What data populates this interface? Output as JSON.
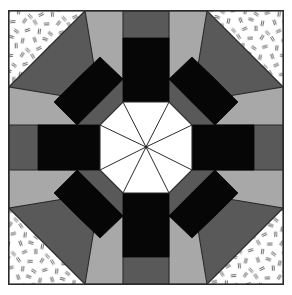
{
  "figure": {
    "title": "Eight-Pointed Star Quilt Block",
    "kind": "geometric-pattern",
    "canvas": {
      "width": 292,
      "height": 295
    },
    "background": "#ffffff"
  },
  "frame": {
    "name": "outer-square-frame",
    "x": 8,
    "y": 10,
    "width": 276,
    "height": 275,
    "fill": "#ffffff",
    "stroke": "#2b2b2b",
    "stroke_width": 1.6
  },
  "palette": {
    "white": "#ffffff",
    "black": "#060606",
    "dark_gray": "#595959",
    "light_gray": "#a8a8a8",
    "outline": "#2b2b2b",
    "texture_mark": "#555555"
  },
  "geometry": {
    "center": {
      "x": 146,
      "y": 147
    },
    "frame_min": 8,
    "frame_max": 284,
    "frame_top": 10,
    "frame_bottom": 285,
    "corner_cut": 77,
    "octagon_ring_outer_note": "octagon inscribed in frame with 77px corner cuts",
    "inner_octagon_radius": 57,
    "black_square_half_width": 23,
    "black_square_inner_edge": 34,
    "black_square_outer_edge": 80,
    "ray_count": 8
  },
  "regions": [
    {
      "name": "corner-triangle-top-left",
      "fill": "textured-white",
      "interactable": false
    },
    {
      "name": "corner-triangle-top-right",
      "fill": "textured-white",
      "interactable": false
    },
    {
      "name": "corner-triangle-bottom-left",
      "fill": "textured-white",
      "interactable": false
    },
    {
      "name": "corner-triangle-bottom-right",
      "fill": "textured-white",
      "interactable": false
    },
    {
      "name": "dark-gray-octagon-ring",
      "fill": "#595959",
      "interactable": false
    },
    {
      "name": "light-gray-kite-north",
      "fill": "#a8a8a8",
      "interactable": false
    },
    {
      "name": "light-gray-kite-east",
      "fill": "#a8a8a8",
      "interactable": false
    },
    {
      "name": "light-gray-kite-south",
      "fill": "#a8a8a8",
      "interactable": false
    },
    {
      "name": "light-gray-kite-west",
      "fill": "#a8a8a8",
      "interactable": false
    },
    {
      "name": "black-square-north",
      "fill": "#060606",
      "interactable": false
    },
    {
      "name": "black-square-east",
      "fill": "#060606",
      "interactable": false
    },
    {
      "name": "black-square-south",
      "fill": "#060606",
      "interactable": false
    },
    {
      "name": "black-square-west",
      "fill": "#060606",
      "interactable": false
    },
    {
      "name": "black-diamond-northwest",
      "fill": "#060606",
      "interactable": false
    },
    {
      "name": "black-diamond-northeast",
      "fill": "#060606",
      "interactable": false
    },
    {
      "name": "black-diamond-southeast",
      "fill": "#060606",
      "interactable": false
    },
    {
      "name": "black-diamond-southwest",
      "fill": "#060606",
      "interactable": false
    },
    {
      "name": "center-octagon",
      "fill": "#ffffff",
      "interactable": false
    }
  ],
  "texture": {
    "name": "scattered-dash-marks",
    "description": "small short double-stroke dashes at random angles on white ground",
    "mark_count_per_corner": 34,
    "mark_length": 5.4,
    "mark_color": "#555555"
  },
  "labels": {
    "alt_text": "Symmetrical eight-pointed star quilt block in black, dark gray, light gray and white with speckled corner triangles."
  }
}
